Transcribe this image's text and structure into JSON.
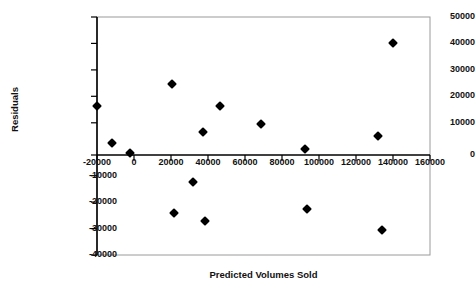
{
  "chart_data": {
    "type": "scatter",
    "title": "",
    "xlabel": "Predicted Volumes Sold",
    "ylabel": "Residuals",
    "xlim": [
      -20000,
      160000
    ],
    "ylim": [
      -40000,
      50000
    ],
    "xticks": [
      -20000,
      0,
      20000,
      40000,
      60000,
      80000,
      100000,
      120000,
      140000,
      160000
    ],
    "yticks": [
      -40000,
      -30000,
      -20000,
      -10000,
      0,
      10000,
      20000,
      30000,
      40000,
      50000
    ],
    "xtick_labels": [
      "-20000",
      "0",
      "20000",
      "40000",
      "60000",
      "80000",
      "100000",
      "120000",
      "140000",
      "160000"
    ],
    "ytick_labels": [
      "-40000",
      "-30000",
      "-20000",
      "-10000",
      "0",
      "10000",
      "20000",
      "30000",
      "40000",
      "50000"
    ],
    "grid": false,
    "legend": false,
    "marker": "diamond",
    "marker_color": "#000000",
    "series": [
      {
        "name": "Residuals",
        "points": [
          {
            "x": 0,
            "y": 16500
          },
          {
            "x": 7000,
            "y": 2500
          },
          {
            "x": 16000,
            "y": -1500
          },
          {
            "x": 36000,
            "y": 24500
          },
          {
            "x": 37000,
            "y": -24000
          },
          {
            "x": 46000,
            "y": -12500
          },
          {
            "x": 51000,
            "y": 6500
          },
          {
            "x": 52000,
            "y": -27000
          },
          {
            "x": 59000,
            "y": 16500
          },
          {
            "x": 79000,
            "y": 9500
          },
          {
            "x": 100000,
            "y": 0
          },
          {
            "x": 101000,
            "y": -22500
          },
          {
            "x": 135000,
            "y": 5000
          },
          {
            "x": 137000,
            "y": -30500
          },
          {
            "x": 142000,
            "y": 40000
          }
        ]
      }
    ]
  },
  "plot": {
    "frame_color": "#808080",
    "axis_color": "#000000",
    "background": "#ffffff"
  }
}
